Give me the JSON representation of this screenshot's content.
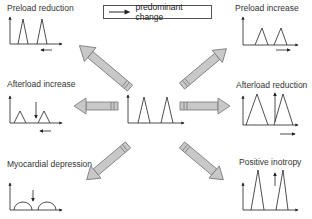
{
  "legend": {
    "label": "predominant change"
  },
  "center": {
    "name": "baseline"
  },
  "panels": {
    "preload_reduction": {
      "title": "Preload reduction"
    },
    "preload_increase": {
      "title": "Preload increase"
    },
    "afterload_increase": {
      "title": "Afterload increase"
    },
    "afterload_reduction": {
      "title": "Afterload reduction"
    },
    "myocardial_depression": {
      "title": "Myocardial depression"
    },
    "positive_inotropy": {
      "title": "Positive inotropy"
    }
  },
  "colors": {
    "arrow_fill": "#c8c8c8",
    "arrow_stroke": "#777777",
    "line": "#222222"
  }
}
